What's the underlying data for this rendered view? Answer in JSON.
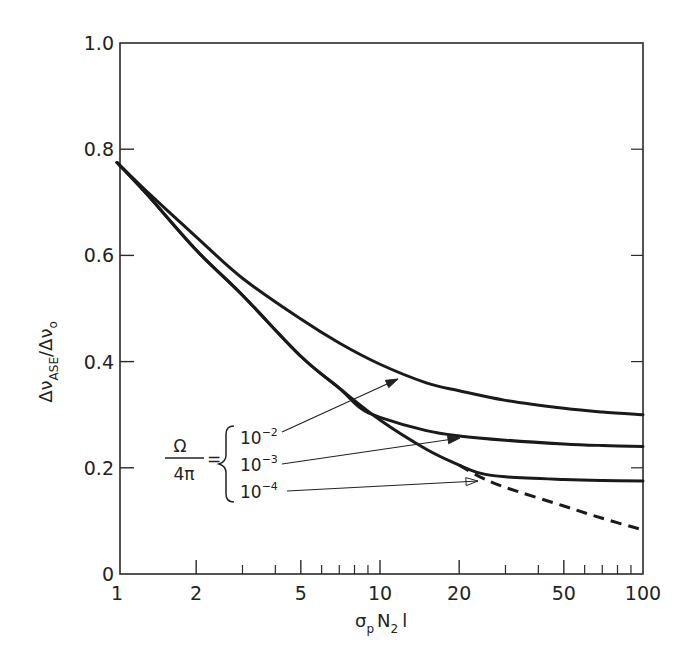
{
  "chart_data": {
    "type": "line",
    "title": "",
    "xlabel": "σp N2 l",
    "xlabel_parts": {
      "base": "σ",
      "sub1": "p",
      "mid": "N",
      "sub2": "2",
      "end": "l"
    },
    "ylabel": "ΔνASE/Δν0",
    "ylabel_parts": {
      "a": "Δν",
      "sub": "ASE",
      "b": "/Δν",
      "sub2": "o"
    },
    "x_scale": "log",
    "xlim": [
      1,
      100
    ],
    "ylim": [
      0,
      1.0
    ],
    "x_ticks": [
      {
        "value": 1,
        "label": "1"
      },
      {
        "value": 2,
        "label": "2"
      },
      {
        "value": 5,
        "label": "5"
      },
      {
        "value": 10,
        "label": "10"
      },
      {
        "value": 20,
        "label": "20"
      },
      {
        "value": 50,
        "label": "50"
      },
      {
        "value": 100,
        "label": "100"
      }
    ],
    "x_minor_ticks": [
      3,
      4,
      6,
      7,
      8,
      9,
      30,
      40,
      60,
      70,
      80,
      90
    ],
    "y_ticks": [
      {
        "value": 0,
        "label": "0"
      },
      {
        "value": 0.2,
        "label": "0.2"
      },
      {
        "value": 0.4,
        "label": "0.4"
      },
      {
        "value": 0.6,
        "label": "0.6"
      },
      {
        "value": 0.8,
        "label": "0.8"
      },
      {
        "value": 1.0,
        "label": "1.0"
      }
    ],
    "grid": false,
    "legend": {
      "title_num": "Ω",
      "title_den": "4π",
      "equals": "=",
      "position": "inside-lower-left-with-arrows",
      "entries": [
        {
          "base": "10",
          "exp": "−2",
          "label": "10^-2"
        },
        {
          "base": "10",
          "exp": "−3",
          "label": "10^-3"
        },
        {
          "base": "10",
          "exp": "−4",
          "label": "10^-4"
        }
      ]
    },
    "series": [
      {
        "name": "Ω/4π = 10^-2",
        "style": "solid",
        "x": [
          1,
          1.3,
          2,
          3,
          5,
          7,
          10,
          15,
          20,
          30,
          50,
          70,
          100
        ],
        "y": [
          0.775,
          0.72,
          0.635,
          0.557,
          0.48,
          0.435,
          0.395,
          0.36,
          0.345,
          0.327,
          0.312,
          0.305,
          0.3
        ]
      },
      {
        "name": "Ω/4π = 10^-3",
        "style": "solid",
        "x": [
          1,
          1.3,
          2,
          3,
          5,
          7,
          8.4,
          10,
          15,
          20,
          30,
          50,
          70,
          100
        ],
        "y": [
          0.775,
          0.715,
          0.61,
          0.525,
          0.41,
          0.35,
          0.313,
          0.295,
          0.27,
          0.26,
          0.252,
          0.245,
          0.242,
          0.24
        ]
      },
      {
        "name": "Ω/4π = 10^-4",
        "style": "solid",
        "x": [
          1,
          1.3,
          2,
          3,
          5,
          7,
          10,
          15,
          20,
          24,
          30,
          50,
          70,
          100
        ],
        "y": [
          0.775,
          0.715,
          0.61,
          0.525,
          0.41,
          0.35,
          0.29,
          0.235,
          0.205,
          0.19,
          0.183,
          0.178,
          0.176,
          0.175
        ]
      },
      {
        "name": "limit (Ω/4π → 0)",
        "style": "dashed",
        "x": [
          20,
          24,
          30,
          50,
          70,
          100
        ],
        "y": [
          0.205,
          0.183,
          0.163,
          0.128,
          0.105,
          0.083
        ]
      }
    ]
  }
}
